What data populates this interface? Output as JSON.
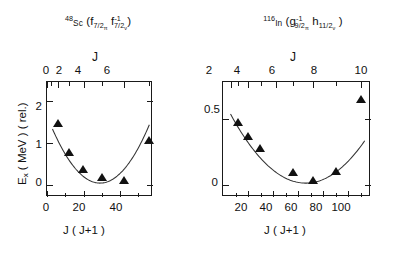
{
  "figure": {
    "background": "#ffffff",
    "marker_color": "#111111",
    "curve_color": "#333333"
  },
  "panels": [
    {
      "id": "left",
      "title": {
        "mass": "48",
        "element": "Sc",
        "open_paren": "(",
        "orbital1_letter": "f",
        "orbital1_sub": "7/2",
        "orbital1_subsub": "π",
        "orbital1_sup": "",
        "orbital2_letter": "f",
        "orbital2_sub": "7/2",
        "orbital2_subsub": "ν",
        "orbital2_sup": "-1",
        "close_paren": ")"
      },
      "top_axis": {
        "label": "J",
        "ticks": [
          0,
          2,
          4,
          6
        ],
        "tick_labels": [
          "0",
          "2",
          "4",
          "6"
        ],
        "minor_ticks": [
          1,
          3,
          5,
          7
        ]
      },
      "bottom_axis": {
        "label": "J ( J+1 )",
        "ticks": [
          0,
          20,
          40
        ],
        "tick_labels": [
          "0",
          "20",
          "40"
        ],
        "minor_ticks": [
          10,
          30,
          50
        ]
      },
      "y_axis": {
        "label": "E_x  ( MeV ) (rel.)",
        "ticks": [
          0,
          1,
          2
        ],
        "tick_labels": [
          "0",
          "1",
          "2"
        ]
      },
      "chart_data": {
        "type": "scatter",
        "title": "48Sc (f7/2π f7/2ν^-1)",
        "xlabel": "J ( J+1 )",
        "ylabel": "E_x ( MeV ) ( rel.)",
        "xlim": [
          0,
          58
        ],
        "ylim": [
          -0.28,
          2.45
        ],
        "grid": false,
        "legend": "none",
        "points": [
          {
            "J": 2,
            "x": 6,
            "y": 1.38
          },
          {
            "J": 3,
            "x": 12,
            "y": 0.69
          },
          {
            "J": 4,
            "x": 20,
            "y": 0.27
          },
          {
            "J": 5,
            "x": 30,
            "y": 0.1
          },
          {
            "J": 6,
            "x": 42,
            "y": 0.02
          },
          {
            "J": 7,
            "x": 56,
            "y": 0.98
          }
        ],
        "fit_curve": {
          "type": "parabola",
          "vertex_x": 29,
          "vertex_y": 0.05,
          "curvature": 0.0019,
          "x_range": [
            3,
            56
          ]
        }
      }
    },
    {
      "id": "right",
      "title": {
        "mass": "116",
        "element": "In",
        "open_paren": "(",
        "orbital1_letter": "g",
        "orbital1_sub": "9/2",
        "orbital1_subsub": "π",
        "orbital1_sup": "-1",
        "orbital2_letter": "h",
        "orbital2_sub": "11/2",
        "orbital2_subsub": "ν",
        "orbital2_sup": "",
        "close_paren": ")"
      },
      "top_axis": {
        "label": "J",
        "ticks": [
          2,
          4,
          6,
          8,
          10
        ],
        "tick_labels": [
          "2",
          "4",
          "6",
          "8",
          "10"
        ],
        "minor_ticks": [
          3,
          5,
          7,
          9
        ]
      },
      "bottom_axis": {
        "label": "J ( J+1 )",
        "ticks": [
          20,
          40,
          60,
          80,
          100
        ],
        "tick_labels": [
          "20",
          "40",
          "60",
          "80",
          "100"
        ],
        "minor_ticks": [
          10,
          30,
          50,
          70,
          90,
          110
        ]
      },
      "y_axis": {
        "ticks": [
          0,
          0.5
        ],
        "tick_labels": [
          "0",
          "0.5"
        ]
      },
      "chart_data": {
        "type": "scatter",
        "title": "116In ( g9/2π^-1 h11/2ν )",
        "xlabel": "J ( J+1 )",
        "ylabel": "",
        "xlim": [
          0,
          118
        ],
        "ylim": [
          -0.09,
          0.78
        ],
        "grid": false,
        "legend": "none",
        "points": [
          {
            "J": 3,
            "x": 12,
            "y": 0.445
          },
          {
            "J": 4,
            "x": 20,
            "y": 0.335
          },
          {
            "J": 5,
            "x": 30,
            "y": 0.245
          },
          {
            "J": 7,
            "x": 56,
            "y": 0.065
          },
          {
            "J": 8,
            "x": 72,
            "y": 0.005
          },
          {
            "J": 9,
            "x": 90,
            "y": 0.075
          },
          {
            "J": 10,
            "x": 110,
            "y": 0.615
          }
        ],
        "fit_curve": {
          "type": "parabola",
          "vertex_x": 66,
          "vertex_y": 0.015,
          "curvature": 0.000145,
          "x_range": [
            6,
            113
          ]
        }
      }
    }
  ]
}
